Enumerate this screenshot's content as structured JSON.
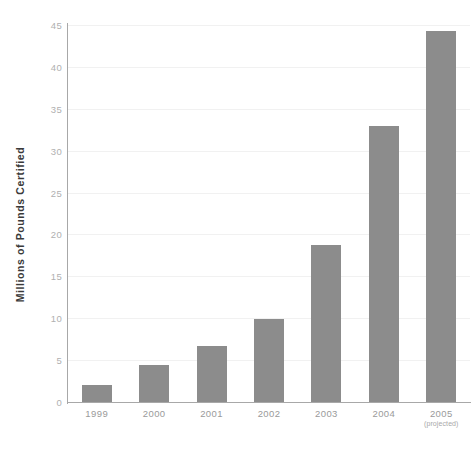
{
  "chart_data": {
    "type": "bar",
    "title": "",
    "subtitle": "",
    "xlabel": "",
    "ylabel": "Millions of Pounds Certified",
    "categories": [
      "1999",
      "2000",
      "2001",
      "2002",
      "2003",
      "2004",
      "2005"
    ],
    "category_sublabels": [
      "",
      "",
      "",
      "",
      "",
      "",
      "(projected)"
    ],
    "values": [
      2.0,
      4.4,
      6.7,
      9.9,
      18.7,
      32.9,
      44.3
    ],
    "ylim": [
      0,
      45
    ],
    "yticks": [
      0,
      5,
      10,
      15,
      20,
      25,
      30,
      35,
      40,
      45
    ],
    "ytick_labels": [
      "0",
      "5",
      "10",
      "15",
      "20",
      "25",
      "30",
      "35",
      "40",
      "45"
    ],
    "xlim_grid": false,
    "grid": "horizontal",
    "legend": "none",
    "bar_color": "#8c8c8c",
    "gridline_color": "#f1f1f1",
    "axis_color": "#a8a8a8",
    "tick_label_color": "#b0b0b0",
    "axis_title_color": "#3a3a3a",
    "background_color": "#ffffff"
  }
}
